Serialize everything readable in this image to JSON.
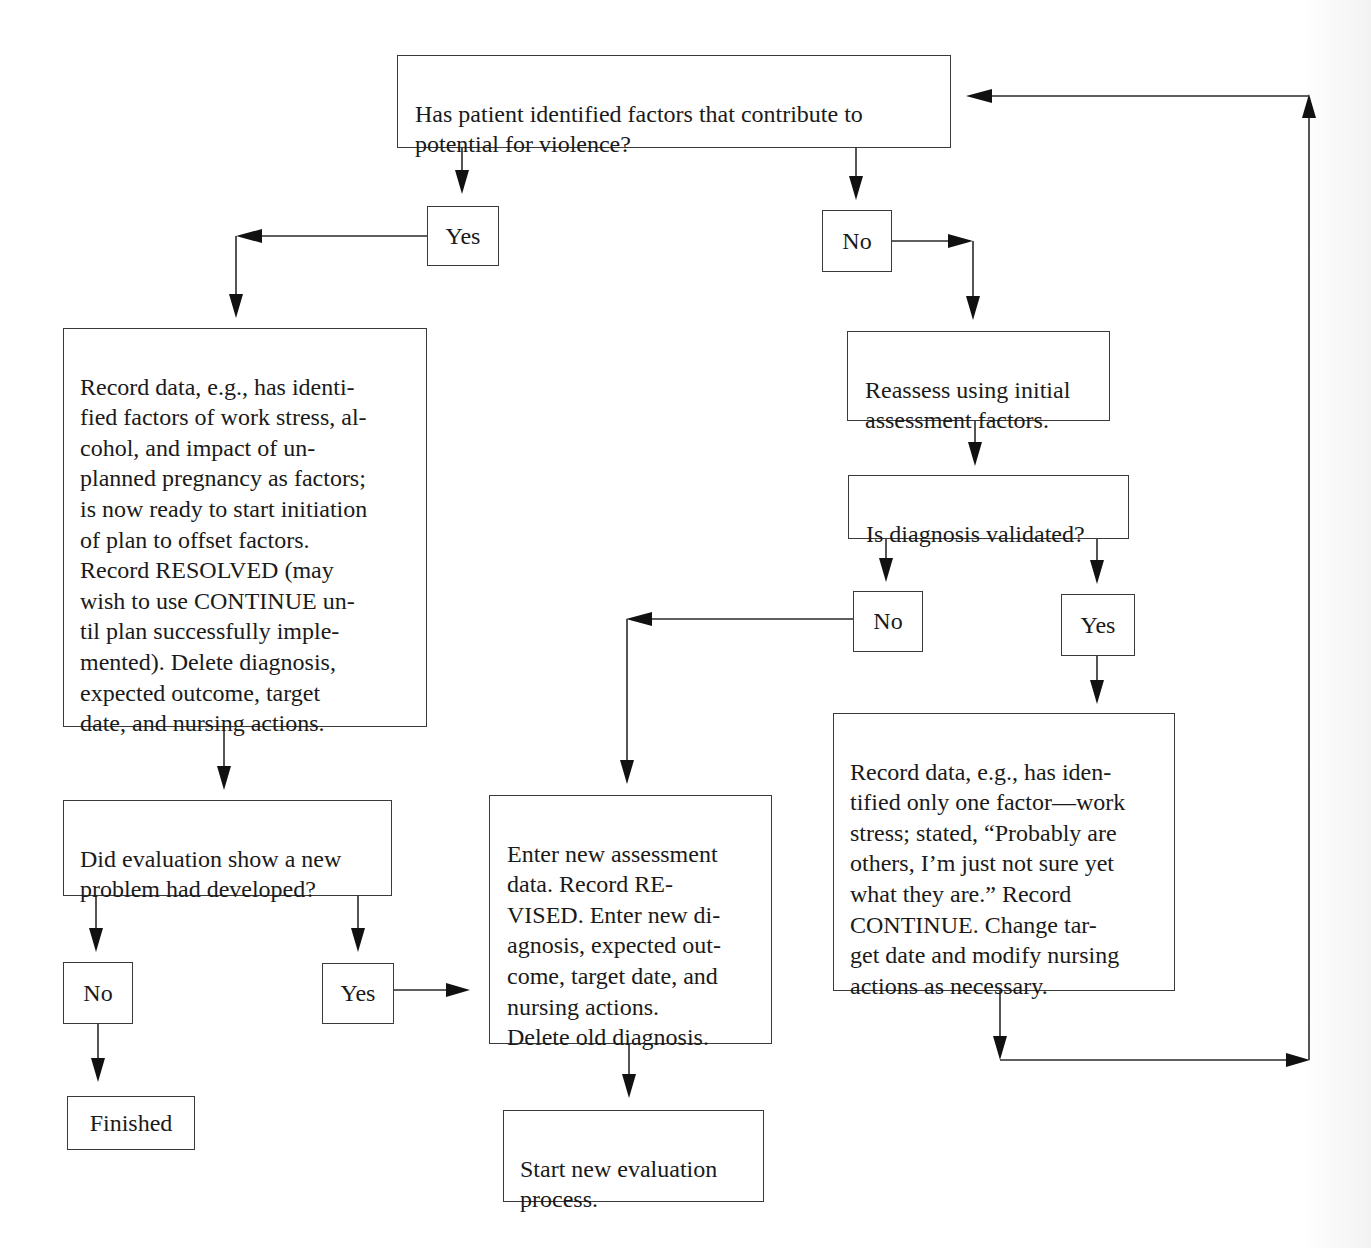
{
  "diagram": {
    "type": "flowchart",
    "nodes": {
      "q_factors": {
        "text": "Has patient identified factors that contribute to\npotential for violence?"
      },
      "yes_1": {
        "text": "Yes"
      },
      "no_1": {
        "text": "No"
      },
      "record_resolved": {
        "text": "Record data, e.g., has identi-\nfied factors of work stress, al-\ncohol, and impact of un-\nplanned pregnancy as factors;\nis now ready to start initiation\nof plan to offset factors.\nRecord RESOLVED (may\nwish to use CONTINUE un-\ntil plan successfully imple-\nmented). Delete diagnosis,\nexpected outcome, target\ndate, and nursing actions."
      },
      "reassess": {
        "text": "Reassess using initial\nassessment factors."
      },
      "q_validated": {
        "text": "Is diagnosis validated?"
      },
      "no_2": {
        "text": "No"
      },
      "yes_2": {
        "text": "Yes"
      },
      "record_continue": {
        "text": "Record data, e.g., has iden-\ntified only one factor—work\nstress; stated, “Probably are\nothers, I’m just not sure yet\nwhat they are.” Record\nCONTINUE. Change tar-\nget date and modify nursing\nactions as necessary."
      },
      "q_new_problem": {
        "text": "Did evaluation show a new\nproblem had developed?"
      },
      "no_3": {
        "text": "No"
      },
      "yes_3": {
        "text": "Yes"
      },
      "finished": {
        "text": "Finished"
      },
      "record_revised": {
        "text": "Enter new assessment\ndata. Record RE-\nVISED. Enter new di-\nagnosis, expected out-\ncome, target date, and\nnursing actions.\nDelete old diagnosis."
      },
      "start_new_eval": {
        "text": "Start new evaluation\nprocess."
      }
    },
    "edges": [
      {
        "from": "q_factors",
        "to": "yes_1"
      },
      {
        "from": "q_factors",
        "to": "no_1"
      },
      {
        "from": "yes_1",
        "to": "record_resolved"
      },
      {
        "from": "no_1",
        "to": "reassess"
      },
      {
        "from": "reassess",
        "to": "q_validated"
      },
      {
        "from": "q_validated",
        "to": "no_2"
      },
      {
        "from": "q_validated",
        "to": "yes_2"
      },
      {
        "from": "no_2",
        "to": "record_revised"
      },
      {
        "from": "yes_2",
        "to": "record_continue"
      },
      {
        "from": "record_continue",
        "to": "q_factors"
      },
      {
        "from": "record_resolved",
        "to": "q_new_problem"
      },
      {
        "from": "q_new_problem",
        "to": "no_3"
      },
      {
        "from": "q_new_problem",
        "to": "yes_3"
      },
      {
        "from": "no_3",
        "to": "finished"
      },
      {
        "from": "yes_3",
        "to": "record_revised"
      },
      {
        "from": "record_revised",
        "to": "start_new_eval"
      }
    ]
  }
}
